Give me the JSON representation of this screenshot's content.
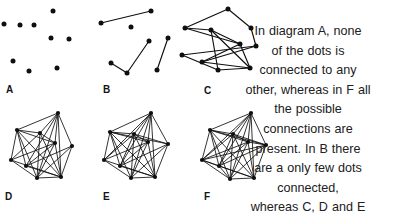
{
  "figure": {
    "background_color": "#ffffff",
    "ink_color": "#0f0f0f",
    "text_color": "#202020"
  },
  "caption": {
    "alignment": "center",
    "full_text": "In diagram A, none of the dots is connected to any other, whereas in F all the possible connections are present. In B there are a only few dots connected, whereas C, D and E have increasing",
    "lines": [
      "In diagram A, none",
      "of the dots is",
      "connected to any",
      "other, whereas in F all",
      "the possible",
      "connections are",
      "present. In B there",
      "are a only few dots",
      "connected,",
      "whereas C, D and E",
      "have increasing"
    ]
  },
  "panels": [
    {
      "id": "A",
      "label": "A",
      "description": "none of the dots is connected to any other",
      "node_count": 9,
      "edge_count": 0,
      "density": "none",
      "label_pos": {
        "x": 6,
        "y": 85
      },
      "origin": {
        "x": 0,
        "y": 0
      },
      "size": {
        "w": 80,
        "h": 80
      },
      "nodes": [
        {
          "x": 4,
          "y": 24
        },
        {
          "x": 20,
          "y": 25
        },
        {
          "x": 34,
          "y": 25
        },
        {
          "x": 53,
          "y": 11
        },
        {
          "x": 51,
          "y": 38
        },
        {
          "x": 69,
          "y": 39
        },
        {
          "x": 13,
          "y": 61
        },
        {
          "x": 29,
          "y": 71
        },
        {
          "x": 57,
          "y": 68
        }
      ],
      "edges": []
    },
    {
      "id": "B",
      "label": "B",
      "description": "a only few dots connected",
      "node_count": 8,
      "edge_count": 4,
      "density": "very low",
      "label_pos": {
        "x": 103,
        "y": 85
      },
      "origin": {
        "x": 95,
        "y": 0
      },
      "size": {
        "w": 85,
        "h": 80
      },
      "nodes": [
        {
          "x": 6,
          "y": 23
        },
        {
          "x": 56,
          "y": 11
        },
        {
          "x": 36,
          "y": 27
        },
        {
          "x": 16,
          "y": 63
        },
        {
          "x": 32,
          "y": 73
        },
        {
          "x": 54,
          "y": 41
        },
        {
          "x": 62,
          "y": 70
        },
        {
          "x": 73,
          "y": 38
        }
      ],
      "edges": [
        [
          0,
          1
        ],
        [
          3,
          4
        ],
        [
          4,
          5
        ],
        [
          6,
          7
        ]
      ]
    },
    {
      "id": "C",
      "label": "C",
      "description": "increasing connections",
      "node_count": 9,
      "edge_count": 12,
      "density": "low-medium",
      "label_pos": {
        "x": 204,
        "y": 86
      },
      "origin": {
        "x": 178,
        "y": 0
      },
      "size": {
        "w": 86,
        "h": 84
      },
      "nodes": [
        {
          "x": 50,
          "y": 9
        },
        {
          "x": 73,
          "y": 28
        },
        {
          "x": 7,
          "y": 28
        },
        {
          "x": 33,
          "y": 30
        },
        {
          "x": 62,
          "y": 44
        },
        {
          "x": 78,
          "y": 46
        },
        {
          "x": 4,
          "y": 55
        },
        {
          "x": 24,
          "y": 62
        },
        {
          "x": 40,
          "y": 70
        },
        {
          "x": 72,
          "y": 68
        }
      ],
      "edges": [
        [
          0,
          2
        ],
        [
          0,
          1
        ],
        [
          1,
          5
        ],
        [
          2,
          3
        ],
        [
          2,
          4
        ],
        [
          3,
          4
        ],
        [
          3,
          8
        ],
        [
          4,
          7
        ],
        [
          4,
          9
        ],
        [
          5,
          7
        ],
        [
          6,
          5
        ],
        [
          6,
          8
        ],
        [
          8,
          9
        ],
        [
          3,
          9
        ],
        [
          7,
          9
        ]
      ]
    },
    {
      "id": "D",
      "label": "D",
      "description": "increasing connections",
      "node_count": 9,
      "edge_count": 24,
      "density": "medium-high",
      "label_pos": {
        "x": 5,
        "y": 192
      },
      "origin": {
        "x": 6,
        "y": 108
      },
      "size": {
        "w": 76,
        "h": 78
      },
      "nodes": [
        {
          "x": 52,
          "y": 5
        },
        {
          "x": 11,
          "y": 22
        },
        {
          "x": 34,
          "y": 25
        },
        {
          "x": 49,
          "y": 35
        },
        {
          "x": 66,
          "y": 38
        },
        {
          "x": 5,
          "y": 52
        },
        {
          "x": 20,
          "y": 58
        },
        {
          "x": 31,
          "y": 70
        },
        {
          "x": 55,
          "y": 69
        }
      ],
      "edges": [
        [
          0,
          1
        ],
        [
          0,
          2
        ],
        [
          0,
          3
        ],
        [
          0,
          4
        ],
        [
          0,
          6
        ],
        [
          0,
          7
        ],
        [
          0,
          8
        ],
        [
          1,
          2
        ],
        [
          1,
          3
        ],
        [
          1,
          5
        ],
        [
          1,
          6
        ],
        [
          1,
          7
        ],
        [
          1,
          8
        ],
        [
          2,
          3
        ],
        [
          2,
          5
        ],
        [
          2,
          7
        ],
        [
          2,
          8
        ],
        [
          3,
          5
        ],
        [
          3,
          6
        ],
        [
          3,
          7
        ],
        [
          3,
          8
        ],
        [
          4,
          6
        ],
        [
          4,
          7
        ],
        [
          4,
          8
        ],
        [
          5,
          7
        ],
        [
          5,
          8
        ],
        [
          6,
          8
        ],
        [
          7,
          8
        ]
      ]
    },
    {
      "id": "E",
      "label": "E",
      "description": "increasing connections",
      "node_count": 9,
      "edge_count": 30,
      "density": "high",
      "label_pos": {
        "x": 103,
        "y": 192
      },
      "origin": {
        "x": 98,
        "y": 108
      },
      "size": {
        "w": 76,
        "h": 78
      },
      "nodes": [
        {
          "x": 53,
          "y": 5
        },
        {
          "x": 12,
          "y": 24
        },
        {
          "x": 36,
          "y": 26
        },
        {
          "x": 50,
          "y": 34
        },
        {
          "x": 70,
          "y": 36
        },
        {
          "x": 6,
          "y": 52
        },
        {
          "x": 22,
          "y": 58
        },
        {
          "x": 33,
          "y": 70
        },
        {
          "x": 57,
          "y": 69
        }
      ],
      "edges": [
        [
          0,
          1
        ],
        [
          0,
          2
        ],
        [
          0,
          3
        ],
        [
          0,
          4
        ],
        [
          0,
          5
        ],
        [
          0,
          6
        ],
        [
          0,
          7
        ],
        [
          0,
          8
        ],
        [
          1,
          2
        ],
        [
          1,
          3
        ],
        [
          1,
          4
        ],
        [
          1,
          5
        ],
        [
          1,
          6
        ],
        [
          1,
          7
        ],
        [
          1,
          8
        ],
        [
          2,
          3
        ],
        [
          2,
          4
        ],
        [
          2,
          5
        ],
        [
          2,
          6
        ],
        [
          2,
          7
        ],
        [
          2,
          8
        ],
        [
          3,
          5
        ],
        [
          3,
          6
        ],
        [
          3,
          7
        ],
        [
          3,
          8
        ],
        [
          4,
          6
        ],
        [
          4,
          7
        ],
        [
          4,
          8
        ],
        [
          5,
          7
        ],
        [
          5,
          8
        ],
        [
          6,
          8
        ],
        [
          7,
          8
        ]
      ]
    },
    {
      "id": "F",
      "label": "F",
      "description": "all the possible connections are present",
      "node_count": 9,
      "edge_count": 36,
      "density": "complete",
      "label_pos": {
        "x": 204,
        "y": 192
      },
      "origin": {
        "x": 196,
        "y": 108
      },
      "size": {
        "w": 76,
        "h": 78
      },
      "nodes": [
        {
          "x": 55,
          "y": 5
        },
        {
          "x": 14,
          "y": 22
        },
        {
          "x": 37,
          "y": 26
        },
        {
          "x": 52,
          "y": 34
        },
        {
          "x": 70,
          "y": 37
        },
        {
          "x": 6,
          "y": 52
        },
        {
          "x": 23,
          "y": 58
        },
        {
          "x": 34,
          "y": 71
        },
        {
          "x": 58,
          "y": 70
        }
      ],
      "edges": [
        [
          0,
          1
        ],
        [
          0,
          2
        ],
        [
          0,
          3
        ],
        [
          0,
          4
        ],
        [
          0,
          5
        ],
        [
          0,
          6
        ],
        [
          0,
          7
        ],
        [
          0,
          8
        ],
        [
          1,
          2
        ],
        [
          1,
          3
        ],
        [
          1,
          4
        ],
        [
          1,
          5
        ],
        [
          1,
          6
        ],
        [
          1,
          7
        ],
        [
          1,
          8
        ],
        [
          2,
          3
        ],
        [
          2,
          4
        ],
        [
          2,
          5
        ],
        [
          2,
          6
        ],
        [
          2,
          7
        ],
        [
          2,
          8
        ],
        [
          3,
          4
        ],
        [
          3,
          5
        ],
        [
          3,
          6
        ],
        [
          3,
          7
        ],
        [
          3,
          8
        ],
        [
          4,
          5
        ],
        [
          4,
          6
        ],
        [
          4,
          7
        ],
        [
          4,
          8
        ],
        [
          5,
          6
        ],
        [
          5,
          7
        ],
        [
          5,
          8
        ],
        [
          6,
          7
        ],
        [
          6,
          8
        ],
        [
          7,
          8
        ]
      ]
    }
  ]
}
